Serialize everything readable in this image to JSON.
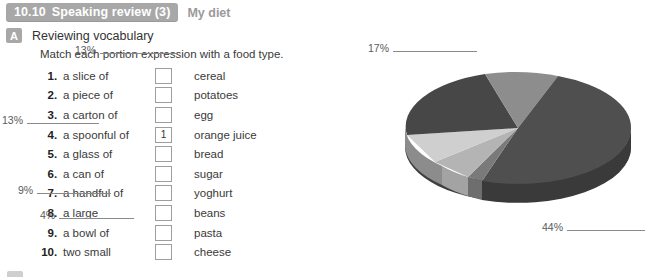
{
  "header": {
    "unit_number": "10.10",
    "unit_title": "Speaking review (3)",
    "topic": "My diet"
  },
  "section": {
    "letter": "A",
    "title": "Reviewing vocabulary",
    "instruction": "Match each portion expression with a food type."
  },
  "list": {
    "items": [
      {
        "num": "1",
        "dot": ".",
        "expression": "a slice of",
        "answer": "",
        "food": "cereal"
      },
      {
        "num": "2",
        "dot": ".",
        "expression": "a piece of",
        "answer": "",
        "food": "potatoes"
      },
      {
        "num": "3",
        "dot": ".",
        "expression": "a carton of",
        "answer": "",
        "food": "egg"
      },
      {
        "num": "4",
        "dot": ".",
        "expression": "a spoonful of",
        "answer": "1",
        "food": "orange juice"
      },
      {
        "num": "5",
        "dot": ".",
        "expression": "a glass of",
        "answer": "",
        "food": "bread"
      },
      {
        "num": "6",
        "dot": ".",
        "expression": "a can of",
        "answer": "",
        "food": "sugar"
      },
      {
        "num": "7",
        "dot": ".",
        "expression": "a handful of",
        "answer": "",
        "food": "yoghurt"
      },
      {
        "num": "8",
        "dot": ".",
        "expression": "a large",
        "answer": "",
        "food": "beans"
      },
      {
        "num": "9",
        "dot": ".",
        "expression": "a bowl of",
        "answer": "",
        "food": "pasta"
      },
      {
        "num": "10",
        "dot": ".",
        "expression": "two small",
        "answer": "",
        "food": "cheese"
      }
    ]
  },
  "chart_data": {
    "type": "pie",
    "title": "",
    "legend_position": "callout-labels",
    "grid": false,
    "labels": [
      "17%",
      "13%",
      "13%",
      "9%",
      "4%",
      "44%"
    ],
    "values": [
      17,
      13,
      13,
      9,
      4,
      44
    ],
    "categories": [
      "",
      "",
      "",
      "",
      "",
      ""
    ],
    "colors": [
      "#8e8e8e",
      "#4a4a4a",
      "#c9c9c9",
      "#b2b2b2",
      "#7c7c7c",
      "#5c5c5c"
    ],
    "callouts": [
      {
        "pct": "17%",
        "blank": ""
      },
      {
        "pct": "13%",
        "blank": ""
      },
      {
        "pct": "13%",
        "blank": ""
      },
      {
        "pct": "9%",
        "blank": ""
      },
      {
        "pct": "4%",
        "blank": ""
      },
      {
        "pct": "44%",
        "blank": ""
      }
    ]
  }
}
